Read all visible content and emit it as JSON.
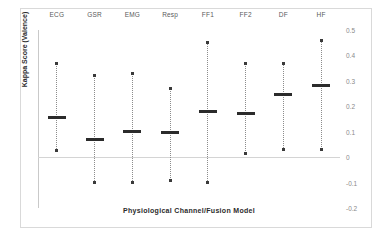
{
  "chart_data": {
    "type": "scatter",
    "title": "",
    "xlabel": "Physiological Channel/Fusion Model",
    "ylabel": "Kappa Score (Valence)",
    "categories": [
      "ECG",
      "GSR",
      "EMG",
      "Resp",
      "FF1",
      "FF2",
      "DF",
      "HF"
    ],
    "ylim": [
      -0.2,
      0.5
    ],
    "yticks": [
      0.5,
      0.4,
      0.3,
      0.2,
      0.1,
      0,
      -0.1,
      -0.2
    ],
    "ytick_labels": [
      "0.5",
      "0.4",
      "0.3",
      "0.2",
      "0.1",
      "0",
      "-0.1",
      "-0.2"
    ],
    "ytick_position": "right",
    "grid": false,
    "zero_line": 0,
    "legend": "none",
    "series": [
      {
        "name": "Kappa Score (Valence) with confidence interval",
        "points": [
          {
            "category": "ECG",
            "mean": 0.155,
            "ci_upper": 0.37,
            "ci_lower": 0.025
          },
          {
            "category": "GSR",
            "mean": 0.07,
            "ci_upper": 0.32,
            "ci_lower": -0.1
          },
          {
            "category": "EMG",
            "mean": 0.1,
            "ci_upper": 0.33,
            "ci_lower": -0.1
          },
          {
            "category": "Resp",
            "mean": 0.095,
            "ci_upper": 0.27,
            "ci_lower": -0.09
          },
          {
            "category": "FF1",
            "mean": 0.18,
            "ci_upper": 0.45,
            "ci_lower": -0.1
          },
          {
            "category": "FF2",
            "mean": 0.17,
            "ci_upper": 0.37,
            "ci_lower": 0.015
          },
          {
            "category": "DF",
            "mean": 0.245,
            "ci_upper": 0.37,
            "ci_lower": 0.03
          },
          {
            "category": "HF",
            "mean": 0.28,
            "ci_upper": 0.46,
            "ci_lower": 0.03
          }
        ]
      }
    ],
    "colors": {
      "marker": "#2b2b2b",
      "whisker": "#8c8c8c",
      "axis": "#c9c9c9",
      "frame": "#d9d9d9",
      "tick_label": "#8a8a8a",
      "category_label": "#5a5a5a",
      "axis_title": "#2b2b2b"
    }
  }
}
